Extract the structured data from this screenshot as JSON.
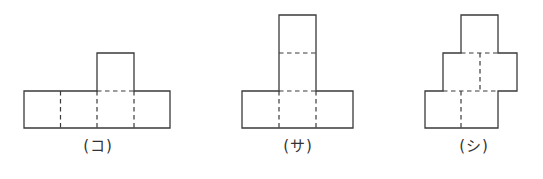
{
  "figures": [
    {
      "id": "ko",
      "label": "(コ)",
      "description": "Net: row of 4 squares with one square above the third"
    },
    {
      "id": "sa",
      "label": "(サ)",
      "description": "Net: row of 3 squares with a column of 2 squares above the middle"
    },
    {
      "id": "shi",
      "label": "(シ)",
      "description": "Net: staircase of squares — 2 bottom, 2 middle shifted right, 1 top"
    }
  ],
  "style": {
    "line_color": "#3a3a3a",
    "background": "#ffffff"
  }
}
